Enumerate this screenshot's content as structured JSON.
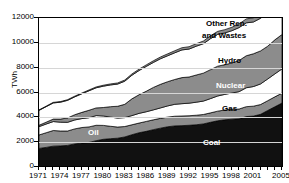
{
  "chart_data": {
    "type": "area",
    "stacked": true,
    "title": "",
    "xlabel": "",
    "ylabel": "TWh",
    "ylim": [
      0,
      12000
    ],
    "ytick_labels": [
      "0",
      "2000",
      "4000",
      "6000",
      "8000",
      "10000",
      "12000"
    ],
    "ytick_values": [
      0,
      2000,
      4000,
      6000,
      8000,
      10000,
      12000
    ],
    "grid": true,
    "legend_position": "inline-labels",
    "x": [
      1971,
      1972,
      1973,
      1974,
      1975,
      1976,
      1977,
      1978,
      1979,
      1980,
      1981,
      1982,
      1983,
      1984,
      1985,
      1986,
      1987,
      1988,
      1989,
      1990,
      1991,
      1992,
      1993,
      1994,
      1995,
      1996,
      1997,
      1998,
      1999,
      2000,
      2001,
      2002,
      2003,
      2004,
      2005
    ],
    "xtick_labels": [
      "1971",
      "1974",
      "1977",
      "1980",
      "1983",
      "1986",
      "1989",
      "1992",
      "1995",
      "1998",
      "2001",
      "2005"
    ],
    "xtick_values": [
      1971,
      1974,
      1977,
      1980,
      1983,
      1986,
      1989,
      1992,
      1995,
      1998,
      2001,
      2005
    ],
    "series": [
      {
        "name": "Coal",
        "color": "#111111",
        "label_color": "#ffffff",
        "values": [
          1500,
          1580,
          1680,
          1700,
          1740,
          1860,
          1930,
          1980,
          2120,
          2230,
          2280,
          2320,
          2420,
          2600,
          2760,
          2870,
          3010,
          3130,
          3240,
          3310,
          3330,
          3360,
          3400,
          3470,
          3600,
          3720,
          3800,
          3850,
          3880,
          4060,
          4100,
          4240,
          4550,
          4850,
          5150
        ]
      },
      {
        "name": "Oil",
        "color": "#8c8c8c",
        "label_color": "#ffffff",
        "values": [
          1080,
          1180,
          1260,
          1200,
          1160,
          1210,
          1250,
          1250,
          1240,
          1120,
          1000,
          900,
          840,
          800,
          780,
          800,
          790,
          790,
          780,
          780,
          780,
          770,
          770,
          760,
          760,
          780,
          790,
          790,
          790,
          800,
          800,
          790,
          790,
          800,
          800
        ]
      },
      {
        "name": "Gas",
        "color": "#ffffff",
        "label_color": "#000000",
        "values": [
          670,
          700,
          720,
          710,
          700,
          720,
          720,
          740,
          780,
          760,
          740,
          720,
          720,
          740,
          780,
          780,
          800,
          840,
          900,
          960,
          990,
          1010,
          1050,
          1080,
          1150,
          1220,
          1260,
          1320,
          1400,
          1520,
          1580,
          1660,
          1750,
          1850,
          1950
        ]
      },
      {
        "name": "Nuclear",
        "color": "#8c8c8c",
        "label_color": "#ffffff",
        "values": [
          110,
          150,
          200,
          250,
          350,
          420,
          500,
          600,
          620,
          680,
          840,
          950,
          1070,
          1350,
          1500,
          1650,
          1810,
          1900,
          1950,
          2000,
          2100,
          2110,
          2190,
          2250,
          2330,
          2400,
          2390,
          2420,
          2510,
          2580,
          2640,
          2660,
          2640,
          2740,
          2770
        ]
      },
      {
        "name": "Hydro",
        "color": "#ffffff",
        "label_color": "#000000",
        "values": [
          1200,
          1250,
          1300,
          1360,
          1420,
          1440,
          1500,
          1570,
          1620,
          1720,
          1750,
          1790,
          1860,
          1900,
          1950,
          2000,
          2010,
          2060,
          2090,
          2150,
          2230,
          2250,
          2320,
          2370,
          2500,
          2560,
          2560,
          2600,
          2650,
          2650,
          2560,
          2630,
          2670,
          2800,
          2920
        ]
      },
      {
        "name": "Other Ren. and Wastes",
        "color": "#8c8c8c",
        "label_color": "#000000",
        "values": [
          40,
          42,
          45,
          48,
          52,
          56,
          60,
          65,
          70,
          76,
          82,
          88,
          95,
          103,
          112,
          122,
          132,
          142,
          152,
          164,
          176,
          188,
          200,
          214,
          228,
          244,
          260,
          278,
          296,
          316,
          336,
          358,
          382,
          408,
          436
        ]
      }
    ]
  },
  "axis": {
    "y_title": "TWh"
  },
  "labels": {
    "other_ren_line1": "Other Ren.",
    "other_ren_line2": "and Wastes",
    "hydro": "Hydro",
    "nuclear": "Nuclear",
    "gas": "Gas",
    "oil": "Oil",
    "coal": "Coal"
  },
  "colors": {
    "dark_band": "#8c8c8c",
    "light_band": "#ffffff",
    "coal_band": "#111111",
    "gridline": "#d6d6d6",
    "axis": "#000000"
  }
}
